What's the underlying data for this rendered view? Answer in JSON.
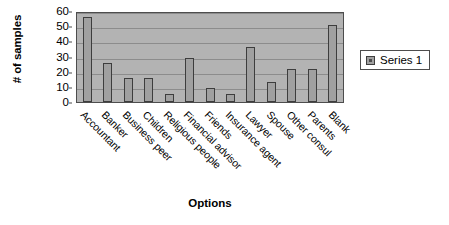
{
  "chart_data": {
    "type": "bar",
    "title": "",
    "xlabel": "Options",
    "ylabel": "# of samples",
    "ylim": [
      0,
      60
    ],
    "yticks": [
      0,
      10,
      20,
      30,
      40,
      50,
      60
    ],
    "grid": true,
    "legend_position": "right",
    "categories": [
      "Accountant",
      "Banker",
      "Business peer",
      "Children",
      "Religious people",
      "Financial advisor",
      "Friends",
      "Insurance agent",
      "Lawyer",
      "Spouse",
      "Other consul",
      "Parents",
      "Blank"
    ],
    "series": [
      {
        "name": "Series 1",
        "color": "#a0a0a0",
        "values": [
          56,
          26,
          16,
          16,
          5,
          29,
          9,
          5,
          36,
          13,
          22,
          22,
          51
        ]
      }
    ]
  },
  "legend": {
    "entries": [
      {
        "label": "Series 1",
        "swatch_name": "series-1-swatch"
      }
    ]
  },
  "colors": {
    "plot_background": "#b3b3b3",
    "gridline": "#8c8c8c",
    "bar_fill": "#a0a0a0",
    "bar_border": "#3d3d3d",
    "axis_line": "#4d4d4d",
    "page_background": "#ffffff",
    "text": "#000000"
  }
}
